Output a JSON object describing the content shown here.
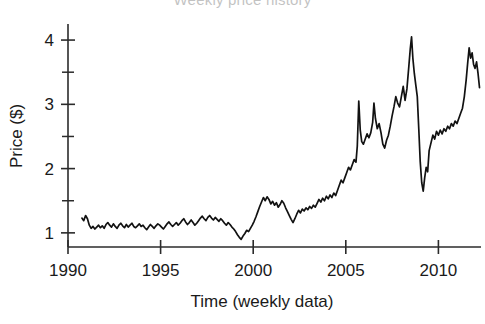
{
  "chart_data": {
    "type": "line",
    "title": "Weekly price history",
    "title_clipped": true,
    "xlabel": "Time (weekly data)",
    "ylabel": "Price ($)",
    "xlim": [
      1990.0,
      2012.3
    ],
    "ylim": [
      0.78,
      4.25
    ],
    "grid": false,
    "legend": null,
    "x_ticks": [
      1990,
      1995,
      2000,
      2005,
      2010
    ],
    "x_tick_labels": [
      "1990",
      "1995",
      "2000",
      "2005",
      "2010"
    ],
    "y_ticks": [
      1,
      2,
      3,
      4
    ],
    "y_tick_labels": [
      "1",
      "2",
      "3",
      "4"
    ],
    "y_minor_ticks": [
      1.5,
      2.5,
      3.5
    ],
    "line_color": "#121212",
    "series": [
      {
        "name": "Price",
        "x": [
          1990.75,
          1990.85,
          1990.95,
          1991.05,
          1991.15,
          1991.25,
          1991.35,
          1991.45,
          1991.55,
          1991.65,
          1991.75,
          1991.85,
          1991.95,
          1992.05,
          1992.15,
          1992.25,
          1992.35,
          1992.45,
          1992.55,
          1992.65,
          1992.75,
          1992.85,
          1992.95,
          1993.05,
          1993.15,
          1993.25,
          1993.35,
          1993.45,
          1993.55,
          1993.65,
          1993.75,
          1993.85,
          1993.95,
          1994.05,
          1994.15,
          1994.25,
          1994.35,
          1994.45,
          1994.55,
          1994.65,
          1994.75,
          1994.85,
          1994.95,
          1995.05,
          1995.15,
          1995.25,
          1995.35,
          1995.45,
          1995.55,
          1995.65,
          1995.75,
          1995.85,
          1995.95,
          1996.05,
          1996.15,
          1996.25,
          1996.35,
          1996.45,
          1996.55,
          1996.65,
          1996.75,
          1996.85,
          1996.95,
          1997.05,
          1997.15,
          1997.25,
          1997.35,
          1997.45,
          1997.55,
          1997.65,
          1997.75,
          1997.85,
          1997.95,
          1998.05,
          1998.15,
          1998.25,
          1998.35,
          1998.45,
          1998.55,
          1998.65,
          1998.75,
          1998.85,
          1998.95,
          1999.05,
          1999.15,
          1999.25,
          1999.35,
          1999.45,
          1999.55,
          1999.65,
          1999.75,
          1999.85,
          1999.95,
          2000.05,
          2000.15,
          2000.25,
          2000.35,
          2000.45,
          2000.55,
          2000.65,
          2000.75,
          2000.85,
          2000.95,
          2001.05,
          2001.15,
          2001.25,
          2001.35,
          2001.45,
          2001.55,
          2001.65,
          2001.75,
          2001.85,
          2001.95,
          2002.05,
          2002.15,
          2002.25,
          2002.35,
          2002.45,
          2002.55,
          2002.65,
          2002.75,
          2002.85,
          2002.95,
          2003.05,
          2003.15,
          2003.25,
          2003.35,
          2003.45,
          2003.55,
          2003.65,
          2003.75,
          2003.85,
          2003.95,
          2004.05,
          2004.15,
          2004.25,
          2004.35,
          2004.45,
          2004.55,
          2004.65,
          2004.75,
          2004.85,
          2004.95,
          2005.05,
          2005.15,
          2005.25,
          2005.35,
          2005.45,
          2005.55,
          2005.62,
          2005.7,
          2005.78,
          2005.86,
          2005.95,
          2006.05,
          2006.15,
          2006.25,
          2006.35,
          2006.45,
          2006.52,
          2006.6,
          2006.7,
          2006.8,
          2006.9,
          2007.0,
          2007.1,
          2007.2,
          2007.3,
          2007.4,
          2007.5,
          2007.6,
          2007.7,
          2007.8,
          2007.9,
          2008.0,
          2008.1,
          2008.2,
          2008.3,
          2008.4,
          2008.48,
          2008.55,
          2008.62,
          2008.7,
          2008.78,
          2008.86,
          2008.94,
          2009.02,
          2009.1,
          2009.18,
          2009.26,
          2009.34,
          2009.42,
          2009.5,
          2009.6,
          2009.7,
          2009.8,
          2009.9,
          2010.0,
          2010.1,
          2010.2,
          2010.3,
          2010.4,
          2010.5,
          2010.6,
          2010.7,
          2010.8,
          2010.9,
          2011.0,
          2011.1,
          2011.2,
          2011.3,
          2011.4,
          2011.5,
          2011.58,
          2011.66,
          2011.74,
          2011.82,
          2011.9,
          2011.98,
          2012.06,
          2012.14,
          2012.22
        ],
        "values": [
          1.23,
          1.19,
          1.27,
          1.22,
          1.12,
          1.07,
          1.1,
          1.06,
          1.09,
          1.12,
          1.08,
          1.11,
          1.07,
          1.13,
          1.16,
          1.12,
          1.09,
          1.14,
          1.1,
          1.07,
          1.12,
          1.15,
          1.11,
          1.08,
          1.13,
          1.09,
          1.12,
          1.15,
          1.1,
          1.08,
          1.11,
          1.14,
          1.1,
          1.12,
          1.08,
          1.05,
          1.09,
          1.13,
          1.1,
          1.07,
          1.11,
          1.14,
          1.12,
          1.09,
          1.06,
          1.1,
          1.14,
          1.17,
          1.13,
          1.1,
          1.13,
          1.16,
          1.12,
          1.15,
          1.19,
          1.22,
          1.17,
          1.13,
          1.16,
          1.2,
          1.16,
          1.12,
          1.15,
          1.19,
          1.23,
          1.26,
          1.22,
          1.19,
          1.24,
          1.27,
          1.23,
          1.2,
          1.24,
          1.21,
          1.18,
          1.22,
          1.19,
          1.15,
          1.12,
          1.16,
          1.13,
          1.09,
          1.06,
          1.02,
          0.97,
          0.93,
          0.9,
          0.95,
          0.99,
          1.04,
          1.02,
          1.07,
          1.12,
          1.18,
          1.25,
          1.33,
          1.41,
          1.48,
          1.55,
          1.5,
          1.56,
          1.52,
          1.45,
          1.49,
          1.43,
          1.47,
          1.4,
          1.44,
          1.5,
          1.46,
          1.39,
          1.33,
          1.27,
          1.21,
          1.16,
          1.22,
          1.29,
          1.35,
          1.31,
          1.37,
          1.34,
          1.39,
          1.36,
          1.41,
          1.38,
          1.43,
          1.4,
          1.46,
          1.52,
          1.48,
          1.54,
          1.5,
          1.57,
          1.53,
          1.59,
          1.55,
          1.62,
          1.58,
          1.66,
          1.74,
          1.82,
          1.78,
          1.86,
          1.94,
          2.02,
          1.98,
          2.06,
          2.14,
          2.1,
          2.35,
          3.05,
          2.6,
          2.42,
          2.38,
          2.46,
          2.54,
          2.48,
          2.56,
          2.72,
          3.02,
          2.78,
          2.62,
          2.7,
          2.56,
          2.38,
          2.32,
          2.44,
          2.52,
          2.66,
          2.82,
          2.96,
          3.12,
          3.02,
          2.96,
          3.12,
          3.28,
          3.06,
          3.24,
          3.58,
          3.86,
          4.05,
          3.72,
          3.48,
          3.3,
          3.12,
          2.62,
          2.1,
          1.78,
          1.65,
          1.86,
          2.02,
          1.95,
          2.28,
          2.4,
          2.52,
          2.46,
          2.58,
          2.52,
          2.6,
          2.54,
          2.62,
          2.58,
          2.66,
          2.62,
          2.7,
          2.66,
          2.74,
          2.7,
          2.78,
          2.86,
          2.94,
          3.12,
          3.38,
          3.64,
          3.88,
          3.72,
          3.8,
          3.62,
          3.56,
          3.66,
          3.48,
          3.26
        ]
      }
    ]
  },
  "axis": {
    "ylabel_text": "Price ($)",
    "xlabel_text": "Time (weekly data)",
    "x_tick_0": "1990",
    "x_tick_1": "1995",
    "x_tick_2": "2000",
    "x_tick_3": "2005",
    "x_tick_4": "2010",
    "y_tick_0": "1",
    "y_tick_1": "2",
    "y_tick_2": "3",
    "y_tick_3": "4"
  }
}
